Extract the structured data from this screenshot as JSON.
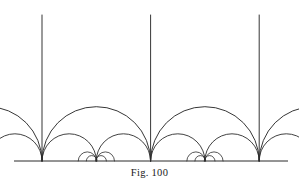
{
  "figure": {
    "caption": "Fig. 100",
    "background_color": "#ffffff",
    "stroke_color": "#2b2b2b",
    "width": 299,
    "height": 187
  },
  "chart_data": {
    "type": "diagram",
    "title": "Fig. 100",
    "subtitle": "",
    "model": "upper-half-plane",
    "grid": false,
    "legend": false,
    "xlabel": "",
    "ylabel": "",
    "baseline": {
      "y": 161,
      "x_start": 14,
      "x_end": 288,
      "stroke_width": 1.0
    },
    "unit_spacing": 108.6,
    "vertical_geodesics": [
      {
        "label": "x = 0",
        "x": 42.0,
        "y_top": 15.0,
        "y_bottom": 161.0
      },
      {
        "label": "x = 1",
        "x": 150.6,
        "y_top": 15.0,
        "y_bottom": 161.0
      },
      {
        "label": "x = 2",
        "x": 259.2,
        "y_top": 15.0,
        "y_bottom": 161.0
      }
    ],
    "semicircle_geodesics": [
      {
        "level": 1,
        "from": -1.0,
        "to": 0.0,
        "center_x": -12.3,
        "radius": 54.3
      },
      {
        "level": 1,
        "from": 0.0,
        "to": 1.0,
        "center_x": 96.3,
        "radius": 54.3
      },
      {
        "level": 1,
        "from": 1.0,
        "to": 2.0,
        "center_x": 204.9,
        "radius": 54.3
      },
      {
        "level": 1,
        "from": 2.0,
        "to": 3.0,
        "center_x": 313.5,
        "radius": 54.3
      },
      {
        "level": 2,
        "from": -0.5,
        "to": 0.0,
        "center_x": 14.9,
        "radius": 27.2
      },
      {
        "level": 2,
        "from": 0.0,
        "to": 0.5,
        "center_x": 69.2,
        "radius": 27.2
      },
      {
        "level": 2,
        "from": 0.5,
        "to": 1.0,
        "center_x": 123.4,
        "radius": 27.2
      },
      {
        "level": 2,
        "from": 1.0,
        "to": 1.5,
        "center_x": 177.8,
        "radius": 27.2
      },
      {
        "level": 2,
        "from": 1.5,
        "to": 2.0,
        "center_x": 232.0,
        "radius": 27.2
      },
      {
        "level": 2,
        "from": 2.0,
        "to": 2.5,
        "center_x": 286.3,
        "radius": 27.2
      },
      {
        "level": 3,
        "from": 0.3333,
        "to": 0.5,
        "center_x": 87.3,
        "radius": 9.1
      },
      {
        "level": 3,
        "from": 0.5,
        "to": 0.6667,
        "center_x": 105.4,
        "radius": 9.1
      },
      {
        "level": 3,
        "from": 1.3333,
        "to": 1.5,
        "center_x": 195.9,
        "radius": 9.1
      },
      {
        "level": 3,
        "from": 1.5,
        "to": 1.6667,
        "center_x": 214.0,
        "radius": 9.1
      },
      {
        "level": 4,
        "from": 0.4,
        "to": 0.5,
        "center_x": 91.7,
        "radius": 5.4
      },
      {
        "level": 4,
        "from": 0.5,
        "to": 0.6,
        "center_x": 101.0,
        "radius": 5.4
      },
      {
        "level": 4,
        "from": 1.4,
        "to": 1.5,
        "center_x": 200.3,
        "radius": 5.4
      },
      {
        "level": 4,
        "from": 1.5,
        "to": 1.6,
        "center_x": 209.6,
        "radius": 5.4
      }
    ]
  }
}
